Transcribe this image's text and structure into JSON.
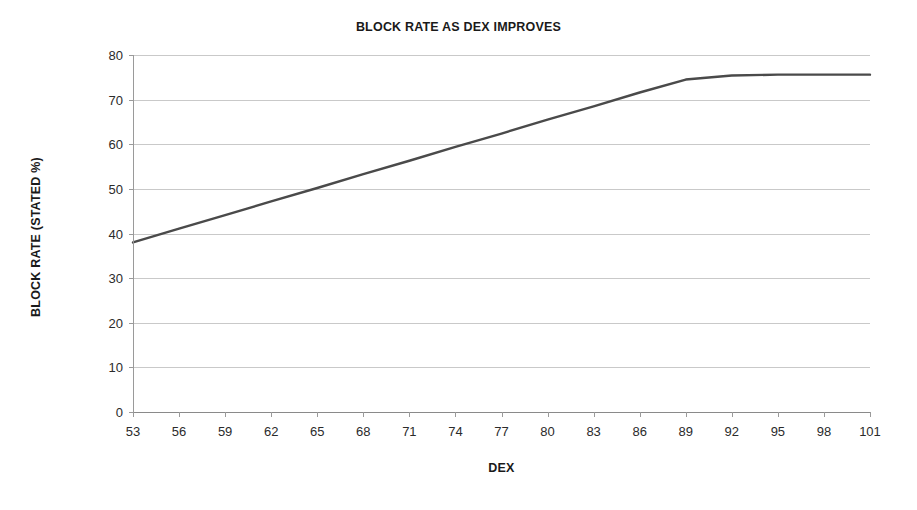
{
  "chart_data": {
    "type": "line",
    "title": "BLOCK RATE AS DEX IMPROVES",
    "xlabel": "DEX",
    "ylabel": "BLOCK RATE (STATED %)",
    "xlim": [
      53,
      101
    ],
    "ylim": [
      0,
      80
    ],
    "grid": true,
    "legend": null,
    "x_ticks": [
      53,
      56,
      59,
      62,
      65,
      68,
      71,
      74,
      77,
      80,
      83,
      86,
      89,
      92,
      95,
      98,
      101
    ],
    "y_ticks": [
      0,
      10,
      20,
      30,
      40,
      50,
      60,
      70,
      80
    ],
    "series": [
      {
        "name": "Block rate",
        "color": "#4a4a4a",
        "line_width": 2.4,
        "x": [
          53,
          56,
          59,
          62,
          65,
          68,
          71,
          74,
          77,
          80,
          83,
          86,
          89,
          92,
          95,
          98,
          101
        ],
        "values": [
          38.0,
          41.1,
          44.1,
          47.2,
          50.2,
          53.3,
          56.3,
          59.4,
          62.4,
          65.5,
          68.5,
          71.6,
          74.5,
          75.4,
          75.6,
          75.6,
          75.6
        ]
      }
    ]
  },
  "chart": {
    "title": "BLOCK RATE AS DEX IMPROVES",
    "x_axis_title": "DEX",
    "y_axis_title": "BLOCK RATE (STATED %)",
    "x_tick_labels": [
      "53",
      "56",
      "59",
      "62",
      "65",
      "68",
      "71",
      "74",
      "77",
      "80",
      "83",
      "86",
      "89",
      "92",
      "95",
      "98",
      "101"
    ],
    "y_tick_labels": [
      "0",
      "10",
      "20",
      "30",
      "40",
      "50",
      "60",
      "70",
      "80"
    ],
    "colors": {
      "line": "#4a4a4a",
      "gridline": "#c9c9c9",
      "axis": "#9a9a9a",
      "text": "#1a1a1a",
      "background": "#ffffff"
    }
  }
}
